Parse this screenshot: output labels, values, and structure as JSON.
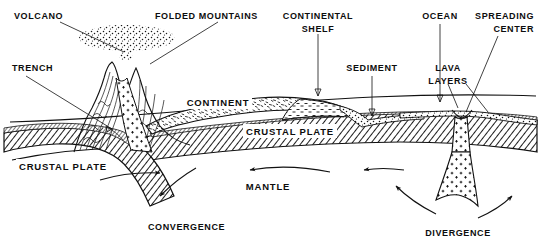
{
  "diagram": {
    "type": "geological-cross-section",
    "background_color": "#ffffff",
    "ink_color": "#111111"
  },
  "labels": {
    "volcano": "VOLCANO",
    "folded_mountains": "FOLDED MOUNTAINS",
    "continental_shelf_line1": "CONTINENTAL",
    "continental_shelf_line2": "SHELF",
    "ocean": "OCEAN",
    "spreading_center_line1": "SPREADING",
    "spreading_center_line2": "CENTER",
    "trench": "TRENCH",
    "sediment": "SEDIMENT",
    "lava_layers_line1": "LAVA",
    "lava_layers_line2": "LAYERS",
    "continent": "CONTINENT",
    "crustal_plate_right": "CRUSTAL PLATE",
    "crustal_plate_left": "CRUSTAL PLATE",
    "mantle": "MANTLE",
    "convergence": "CONVERGENCE",
    "divergence": "DIVERGENCE"
  },
  "features": {
    "volcano": {
      "name": "volcano-with-ash-plume",
      "description": "erupting volcano with ash cloud above summit"
    },
    "folded_mountains": {
      "name": "folded-mountain-strata",
      "description": "contorted folded rock layers forming mountain range"
    },
    "subduction_zone": {
      "name": "subducting-slab",
      "description": "left crustal plate descending beneath continent"
    },
    "spreading_center": {
      "name": "mid-ocean-ridge-rift",
      "description": "rift with rising magma conduit marked by plus symbols"
    },
    "mantle_convection": {
      "name": "convection-arrows",
      "count": 6
    }
  }
}
